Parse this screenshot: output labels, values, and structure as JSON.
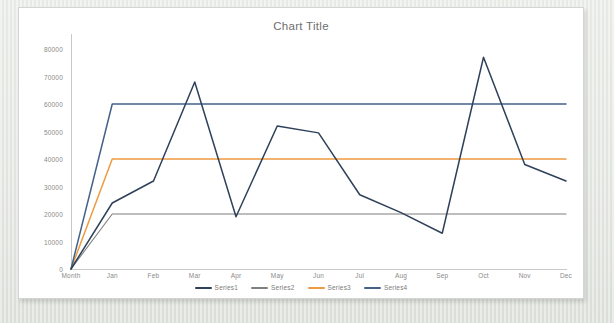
{
  "chart_data": {
    "type": "line",
    "title": "Chart Title",
    "xlabel": "",
    "ylabel": "",
    "categories": [
      "Month",
      "Jan",
      "Feb",
      "Mar",
      "Apr",
      "May",
      "Jun",
      "Jul",
      "Aug",
      "Sep",
      "Oct",
      "Nov",
      "Dec"
    ],
    "ylim": [
      0,
      80000
    ],
    "yticks": [
      0,
      10000,
      20000,
      30000,
      40000,
      50000,
      60000,
      70000,
      80000
    ],
    "ytick_labels": [
      "0",
      "10000",
      "20000",
      "30000",
      "40000",
      "50000",
      "60000",
      "70000",
      "80000"
    ],
    "grid": false,
    "legend_position": "bottom",
    "series": [
      {
        "name": "Series1",
        "color": "#2e4159",
        "values": [
          0,
          24000,
          32000,
          68000,
          19000,
          52000,
          49500,
          27000,
          20500,
          13000,
          77000,
          38000,
          32000
        ]
      },
      {
        "name": "Series2",
        "color": "#7f7f7f",
        "values": [
          0,
          20000,
          20000,
          20000,
          20000,
          20000,
          20000,
          20000,
          20000,
          20000,
          20000,
          20000,
          20000
        ]
      },
      {
        "name": "Series3",
        "color": "#ed9b40",
        "values": [
          0,
          40000,
          40000,
          40000,
          40000,
          40000,
          40000,
          40000,
          40000,
          40000,
          40000,
          40000,
          40000
        ]
      },
      {
        "name": "Series4",
        "color": "#44618a",
        "values": [
          0,
          60000,
          60000,
          60000,
          60000,
          60000,
          60000,
          60000,
          60000,
          60000,
          60000,
          60000,
          60000
        ]
      }
    ]
  },
  "legend": {
    "items": [
      {
        "label": "Series1",
        "color": "#2e4159"
      },
      {
        "label": "Series2",
        "color": "#7f7f7f"
      },
      {
        "label": "Series3",
        "color": "#ed9b40"
      },
      {
        "label": "Series4",
        "color": "#44618a"
      }
    ]
  },
  "colors": {
    "card_background": "#ffffff",
    "card_border": "#d4d4d4",
    "page_background": "#e9ebe6",
    "axis": "#c9c9c9",
    "tick_text": "#8a8a8a",
    "title_text": "#6e6e6e"
  }
}
